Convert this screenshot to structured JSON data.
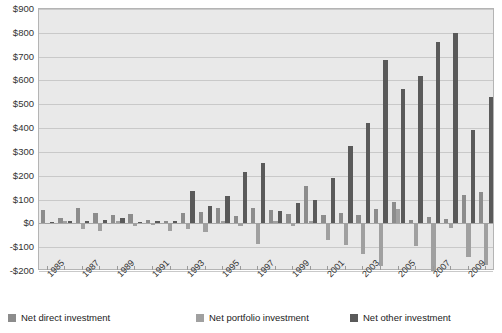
{
  "chart_data": {
    "type": "bar",
    "title": "",
    "subtitle": "",
    "xlabel": "",
    "ylabel": "",
    "grid": true,
    "legend_position": "bottom",
    "ylim": [
      -200,
      900
    ],
    "ytick_step": 100,
    "ytick_labels": [
      "$900",
      "$800",
      "$700",
      "$600",
      "$500",
      "$400",
      "$300",
      "$200",
      "$100",
      "$0",
      "-$100",
      "-$200"
    ],
    "ytick_values": [
      900,
      800,
      700,
      600,
      500,
      400,
      300,
      200,
      100,
      0,
      -100,
      -200
    ],
    "categories": [
      1985,
      1986,
      1987,
      1988,
      1989,
      1990,
      1991,
      1992,
      1993,
      1994,
      1995,
      1996,
      1997,
      1998,
      1999,
      2000,
      2001,
      2002,
      2003,
      2004,
      2005,
      2006,
      2007,
      2008,
      2009,
      2010
    ],
    "xtick_labels": [
      "1985",
      "1987",
      "1989",
      "1991",
      "1993",
      "1995",
      "1997",
      "1999",
      "2001",
      "2003",
      "2005",
      "2007",
      "2009"
    ],
    "xtick_label_values": [
      1985,
      1987,
      1989,
      1991,
      1993,
      1995,
      1997,
      1999,
      2001,
      2003,
      2005,
      2007,
      2009
    ],
    "series": [
      {
        "name": "Net direct investment",
        "color": "#8c8c8c",
        "values": [
          55,
          22,
          63,
          45,
          37,
          40,
          15,
          12,
          45,
          48,
          63,
          30,
          66,
          55,
          40,
          155,
          35,
          45,
          35,
          60,
          90,
          15,
          25,
          20,
          120,
          130
        ]
      },
      {
        "name": "Net portfolio investment",
        "color": "#a0a0a0",
        "values": [
          2,
          12,
          -22,
          -32,
          12,
          -10,
          -8,
          -30,
          -22,
          -35,
          10,
          -12,
          -85,
          8,
          -10,
          10,
          -70,
          -90,
          -130,
          -180,
          60,
          -95,
          -200,
          -18,
          -140,
          -175
        ]
      },
      {
        "name": "Net other investment",
        "color": "#5a5a5a",
        "values": [
          5,
          8,
          8,
          14,
          22,
          5,
          8,
          12,
          135,
          75,
          115,
          215,
          255,
          52,
          85,
          100,
          190,
          325,
          420,
          685,
          565,
          620,
          760,
          800,
          390,
          530
        ]
      }
    ]
  },
  "legend": {
    "items": [
      {
        "label": "Net direct investment",
        "color": "#8c8c8c",
        "icon": "legend-swatch-icon"
      },
      {
        "label": "Net portfolio investment",
        "color": "#a0a0a0",
        "icon": "legend-swatch-icon"
      },
      {
        "label": "Net other investment",
        "color": "#5a5a5a",
        "icon": "legend-swatch-icon"
      }
    ]
  }
}
